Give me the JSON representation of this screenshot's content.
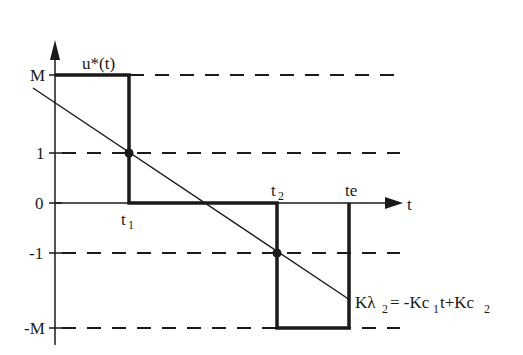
{
  "diagram": {
    "axes": {
      "x_label": "t",
      "y_levels": [
        {
          "name": "M",
          "label": "M",
          "value": "M"
        },
        {
          "name": "one",
          "label": "1",
          "value": "1"
        },
        {
          "name": "zero",
          "label": "0",
          "value": "0"
        },
        {
          "name": "minus-one",
          "label": "-1",
          "value": "-1"
        },
        {
          "name": "minus-M",
          "label": "-M",
          "value": "-M"
        }
      ]
    },
    "curve_label": "u*(t)",
    "time_points": {
      "t1": {
        "base": "t",
        "sub": "1"
      },
      "t2": {
        "base": "t",
        "sub": "2"
      },
      "te": {
        "label": "te"
      }
    },
    "switching_line": {
      "lhs_base": "Kλ",
      "lhs_sub": "2",
      "eq": "= -Kc",
      "c1_sub": "1",
      "mid": "t+Kc",
      "c2_sub": "2"
    },
    "colors": {
      "ink": "#1a1a1a",
      "background": "#ffffff"
    }
  }
}
